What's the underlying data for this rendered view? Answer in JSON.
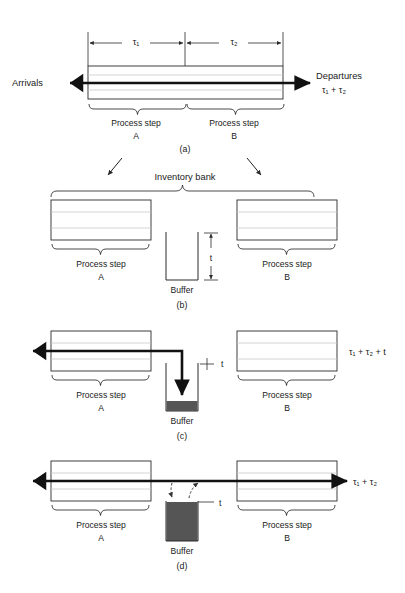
{
  "figure": {
    "panels": [
      {
        "id": "(a)",
        "arrivals_label": "Arrivals",
        "departures_label": "Departures",
        "departures_time": "τ₁ + τ₂",
        "dim_tau1": "τ₁",
        "dim_tau2": "τ₂",
        "step_a_label": "Process step",
        "step_a_name": "A",
        "step_b_label": "Process step",
        "step_b_name": "B"
      },
      {
        "id": "(b)",
        "inventory_bank_label": "Inventory bank",
        "buffer_label": "Buffer",
        "buffer_height_label": "t",
        "step_a_label": "Process step",
        "step_a_name": "A",
        "step_b_label": "Process step",
        "step_b_name": "B"
      },
      {
        "id": "(c)",
        "buffer_label": "Buffer",
        "buffer_height_label": "t",
        "total_time": "τ₁ + τ₂ + t",
        "step_a_label": "Process step",
        "step_a_name": "A",
        "step_b_label": "Process step",
        "step_b_name": "B"
      },
      {
        "id": "(d)",
        "buffer_label": "Buffer",
        "buffer_height_label": "t",
        "total_time": "τ₁ + τ₂",
        "step_a_label": "Process step",
        "step_a_name": "A",
        "step_b_label": "Process step",
        "step_b_name": "B"
      }
    ],
    "colors": {
      "background": "#ffffff",
      "line": "#1a1a1a",
      "box_stroke": "#2b2b2b",
      "box_inner_line": "#c9c9c9",
      "buffer_fill": "#555555",
      "flow_arrow": "#111111"
    }
  }
}
